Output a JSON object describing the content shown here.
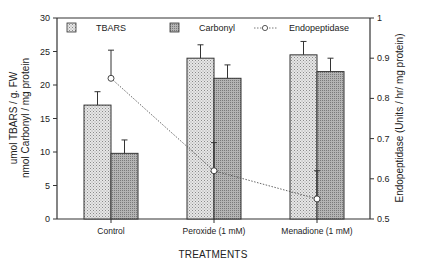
{
  "chart_data": {
    "type": "bar",
    "title": "",
    "xlabel": "TREATMENTS",
    "ylabel": [
      "umol TBARS / g. FW",
      "nmol Carbonyl / mg protein"
    ],
    "y2label": "Endopeptidase (Units / hr/ mg protein)",
    "categories": [
      "Control",
      "Peroxide (1 mM)",
      "Menadione (1 mM)"
    ],
    "ylim": [
      0,
      30
    ],
    "yticks": [
      0,
      5,
      10,
      15,
      20,
      25,
      30
    ],
    "y2lim": [
      0.5,
      1.0
    ],
    "y2ticks": [
      0.5,
      0.6,
      0.7,
      0.8,
      0.9,
      1
    ],
    "grid": false,
    "legend_position": "top",
    "series": [
      {
        "name": "TBARS",
        "type": "bar",
        "axis": "left",
        "pattern": "light-dotted",
        "values": [
          17,
          24,
          24.5
        ],
        "errors": [
          2,
          2,
          2
        ]
      },
      {
        "name": "Carbonyl",
        "type": "bar",
        "axis": "left",
        "pattern": "dark-dotted",
        "values": [
          9.8,
          21,
          22
        ],
        "errors": [
          2,
          2,
          2
        ]
      },
      {
        "name": "Endopeptidase",
        "type": "line",
        "axis": "right",
        "style": "dashed-open-circle",
        "values": [
          0.85,
          0.62,
          0.55
        ],
        "errors": [
          0.07,
          0.07,
          0.07
        ]
      }
    ]
  },
  "legend": {
    "tbars": "TBARS",
    "carbonyl": "Carbonyl",
    "endopeptidase": "Endopeptidase"
  }
}
